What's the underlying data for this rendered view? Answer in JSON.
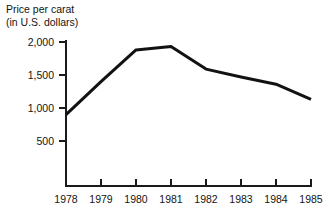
{
  "chart_data": {
    "type": "line",
    "title": "Price per carat",
    "subtitle": "(in U.S. dollars)",
    "xlabel": "",
    "ylabel": "",
    "x": [
      1978,
      1979,
      1980,
      1981,
      1982,
      1983,
      1984,
      1985
    ],
    "categories": [
      "1978",
      "1979",
      "1980",
      "1981",
      "1982",
      "1983",
      "1984",
      "1985"
    ],
    "values": [
      900,
      1400,
      1880,
      1930,
      1590,
      1470,
      1360,
      1130
    ],
    "series": [
      {
        "name": "Price per carat",
        "values": [
          900,
          1400,
          1880,
          1930,
          1590,
          1470,
          1360,
          1130
        ]
      }
    ],
    "ylim": [
      0,
      2100
    ],
    "yticks": [
      500,
      1000,
      1500,
      2000
    ],
    "ytick_labels": [
      "500",
      "1,000",
      "1,500",
      "2,000"
    ],
    "xtick_labels": [
      "1978",
      "1979",
      "1980",
      "1981",
      "1982",
      "1983",
      "1984",
      "1985"
    ],
    "grid": false,
    "legend": "none",
    "line_color": "#121212",
    "background_color": "#ffffff"
  },
  "labels": {
    "title_line1": "Price per carat",
    "title_line2": "(in U.S. dollars)"
  }
}
